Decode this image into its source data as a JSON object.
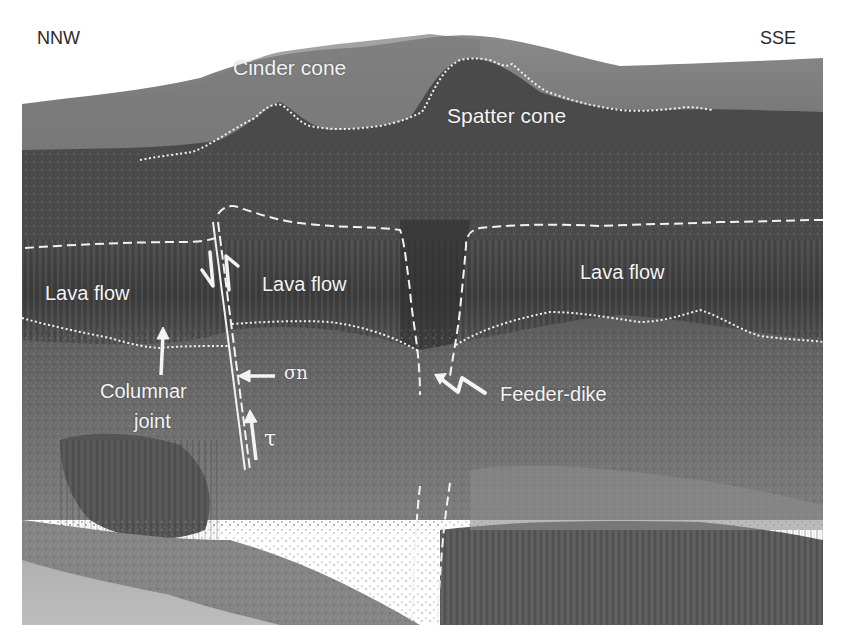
{
  "figure": {
    "orientation": {
      "left": "NNW",
      "right": "SSE"
    },
    "labels": {
      "cinder_cone": "Cinder cone",
      "spatter_cone": "Spatter cone",
      "lava_flow_left": "Lava flow",
      "lava_flow_center": "Lava flow",
      "lava_flow_right": "Lava flow",
      "columnar_joint_line1": "Columnar",
      "columnar_joint_line2": "joint",
      "feeder_dike": "Feeder-dike",
      "normal_stress": "σn",
      "shear_stress": "τ"
    },
    "colors": {
      "background": "#ffffff",
      "annotation": "#f4f4f4",
      "direction_text": "#2a2a2a",
      "rock_dark": "#3a3a3a",
      "rock_mid": "#6a6a6a",
      "rock_light": "#9a9a9a",
      "sky": "#ffffff",
      "water": "#b8b8b8"
    }
  }
}
